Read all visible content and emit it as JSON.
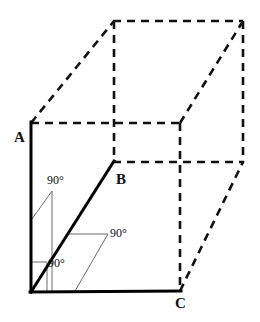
{
  "figure": {
    "kind": "3d-box-perspective-diagram",
    "width": 260,
    "height": 322,
    "background_color": "#ffffff",
    "solid_stroke_color": "#000000",
    "dashed_stroke_color": "#111111",
    "leader_stroke_color": "#6b6b6b",
    "solid_stroke_width": 3,
    "dashed_stroke_width": 2.6,
    "leader_stroke_width": 1,
    "dash_pattern": "8 6"
  },
  "vertices": {
    "O": {
      "x": 31,
      "y": 292,
      "label": ""
    },
    "A": {
      "x": 31,
      "y": 123,
      "label": "A"
    },
    "B": {
      "x": 113,
      "y": 162,
      "label": "B"
    },
    "C": {
      "x": 180,
      "y": 291,
      "label": "C"
    },
    "top_back_left": {
      "x": 114,
      "y": 21,
      "label": ""
    },
    "top_back_right": {
      "x": 243,
      "y": 21,
      "label": ""
    },
    "right_back_mid": {
      "x": 243,
      "y": 162,
      "label": ""
    },
    "top_front_right": {
      "x": 180,
      "y": 123,
      "label": ""
    }
  },
  "vertex_labels": [
    {
      "name": "A",
      "text": "A"
    },
    {
      "name": "B",
      "text": "B"
    },
    {
      "name": "C",
      "text": "C"
    }
  ],
  "edges": {
    "solid": [
      {
        "name": "edge-OA",
        "from": "O",
        "to": "A",
        "style": "solid"
      },
      {
        "name": "edge-OB",
        "from": "O",
        "to": "B",
        "style": "solid"
      },
      {
        "name": "edge-OC",
        "from": "O",
        "to": "C",
        "style": "solid"
      }
    ],
    "dashed": [
      {
        "name": "edge-A-topbackleft",
        "x1": 31,
        "y1": 123,
        "x2": 114,
        "y2": 21
      },
      {
        "name": "edge-topbackleft-topbackright",
        "x1": 114,
        "y1": 21,
        "x2": 243,
        "y2": 21
      },
      {
        "name": "edge-topbackright-rightbackmid",
        "x1": 243,
        "y1": 21,
        "x2": 243,
        "y2": 162
      },
      {
        "name": "edge-topbackleft-down",
        "x1": 114,
        "y1": 21,
        "x2": 114,
        "y2": 162
      },
      {
        "name": "edge-A-topfrontright",
        "x1": 31,
        "y1": 123,
        "x2": 180,
        "y2": 123
      },
      {
        "name": "edge-topfrontright-topbackright",
        "x1": 180,
        "y1": 123,
        "x2": 243,
        "y2": 21
      },
      {
        "name": "edge-topfrontright-down",
        "x1": 180,
        "y1": 123,
        "x2": 180,
        "y2": 291
      },
      {
        "name": "edge-B-rightbackmid",
        "x1": 113,
        "y1": 162,
        "x2": 243,
        "y2": 162
      },
      {
        "name": "edge-C-rightbackmid",
        "x1": 180,
        "y1": 291,
        "x2": 243,
        "y2": 162
      }
    ]
  },
  "angle_marks": [
    {
      "name": "angle-between-OA-and-OB",
      "text": "90°",
      "leader_from": {
        "x": 52,
        "y": 191
      },
      "leader_to": {
        "x": 32,
        "y": 219
      },
      "drop_from": {
        "x": 52,
        "y": 191
      },
      "drop_to": {
        "x": 52,
        "y": 292
      }
    },
    {
      "name": "angle-between-OB-and-OC",
      "text": "90°",
      "leader_from": {
        "x": 108,
        "y": 234
      },
      "leader_to": {
        "x": 68,
        "y": 234
      },
      "drop_from": {
        "x": 108,
        "y": 234
      },
      "drop_to": {
        "x": 75,
        "y": 291
      }
    },
    {
      "name": "angle-between-OA-and-OC",
      "text": "90°",
      "leader_from": {
        "x": 47,
        "y": 262
      },
      "leader_to": {
        "x": 31,
        "y": 262
      },
      "drop_from": {
        "x": 47,
        "y": 262
      },
      "drop_to": {
        "x": 47,
        "y": 292
      }
    }
  ]
}
